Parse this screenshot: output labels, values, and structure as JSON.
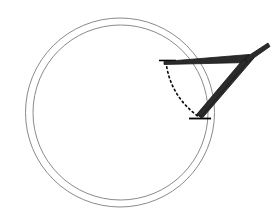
{
  "canvas": {
    "width": 280,
    "height": 224,
    "background": "#ffffff"
  },
  "figure": {
    "type": "geometric-line-diagram",
    "title": ""
  },
  "colors": {
    "circle_stroke": "#8a8a8a",
    "wedge_stroke": "#1a1a1a",
    "wedge_fill": "#2b2b2b",
    "dotted_stroke": "#111111",
    "tick_stroke": "#000000",
    "background": "#ffffff"
  },
  "shapes": {
    "outer_circle": {
      "name": "outer-circle",
      "cx": 120,
      "cy": 112.5,
      "r": 94.5,
      "stroke_width": 1.0
    },
    "inner_circle": {
      "name": "inner-circle",
      "cx": 120.5,
      "cy": 112.5,
      "r": 87.5,
      "stroke_width": 1.0
    },
    "dotted_arc": {
      "name": "dotted-arc",
      "start_x": 166,
      "start_y": 62,
      "end_x": 199,
      "end_y": 117,
      "control_x": 170,
      "control_y": 96,
      "dash": "1.6 3.2",
      "stroke_width": 1.7
    },
    "tick_top": {
      "name": "tick-mark-top",
      "x1": 159,
      "y1": 60.5,
      "x2": 176,
      "y2": 60.5,
      "stroke_width": 1.6
    },
    "tick_bottom": {
      "name": "tick-mark-bottom",
      "x1": 189,
      "y1": 118.5,
      "x2": 211,
      "y2": 118.5,
      "stroke_width": 1.8
    },
    "wedge_top_bar": {
      "name": "wedge-top-bar",
      "points": "164,61.5 249,54.5 249,62.5 164,64.5"
    },
    "wedge_right_limb": {
      "name": "wedge-right-limb",
      "points": "249,54.5 254,58 202,118.5 197,114.5"
    },
    "wedge_inner_limb": {
      "name": "wedge-inner-limb",
      "points": "243,59.5 247,62 201,117 197,114"
    },
    "wedge_tip": {
      "name": "wedge-tip",
      "points": "245,58 268,43 270,46.5 248,62"
    },
    "wedge_outline": {
      "name": "wedge-outline-triangle",
      "points": "164,62.5 249,58.5 200,118"
    }
  }
}
